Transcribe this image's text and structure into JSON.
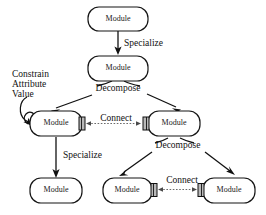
{
  "diagram": {
    "background_color": "#ffffff",
    "line_color": "#111111",
    "port_color": "#b9b9b9",
    "nodes": [
      {
        "id": "n1",
        "label": "Module"
      },
      {
        "id": "n2",
        "label": "Module"
      },
      {
        "id": "n3",
        "label": "Module"
      },
      {
        "id": "n4",
        "label": "Module"
      },
      {
        "id": "n5",
        "label": "Module"
      },
      {
        "id": "n6",
        "label": "Module"
      },
      {
        "id": "n7",
        "label": "Module"
      }
    ],
    "edge_labels": {
      "specialize_top": "Specialize",
      "decompose_top": "Decompose",
      "constrain_line1": "Constrain",
      "constrain_line2": "Attribute",
      "constrain_line3": "Value",
      "connect_middle": "Connect",
      "specialize_left": "Specialize",
      "decompose_right": "Decompose",
      "connect_bottom": "Connect"
    }
  }
}
